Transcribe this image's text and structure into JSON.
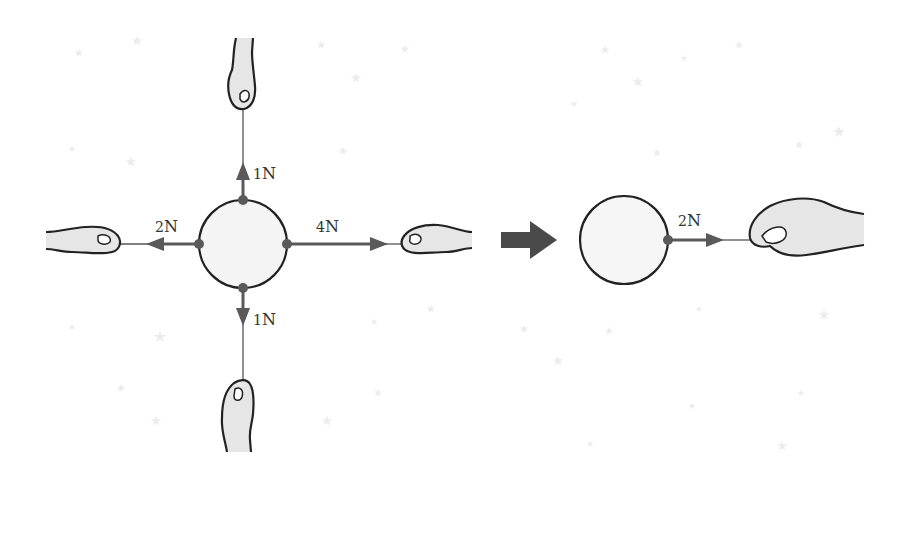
{
  "diagram": {
    "colors": {
      "arrow": "#5a5a5a",
      "outline": "#222222",
      "hand_fill": "#e6e6e6",
      "circle_fill": "#f4f4f4",
      "star": "#ebebeb",
      "transition_arrow": "#4a4a4a"
    },
    "left_scene": {
      "object": "circle",
      "forces": [
        {
          "id": "up",
          "direction": "up",
          "magnitude": "1",
          "unit": "N"
        },
        {
          "id": "down",
          "direction": "down",
          "magnitude": "1",
          "unit": "N"
        },
        {
          "id": "left",
          "direction": "left",
          "magnitude": "2",
          "unit": "N"
        },
        {
          "id": "right",
          "direction": "right",
          "magnitude": "4",
          "unit": "N"
        }
      ]
    },
    "transition": {
      "icon": "right-arrow-icon"
    },
    "right_scene": {
      "object": "circle",
      "forces": [
        {
          "id": "net",
          "direction": "right",
          "magnitude": "2",
          "unit": "N"
        }
      ]
    }
  }
}
